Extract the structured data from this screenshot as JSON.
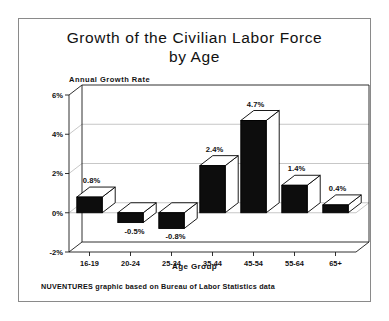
{
  "figure": {
    "title": "Growth of the Civilian Labor Force\nby Age",
    "footer": "NUVENTURES graphic based on Bureau of Labor Statistics data"
  },
  "chart_data": {
    "type": "bar",
    "title": "Growth of the Civilian Labor Force by Age",
    "xlabel": "Age Group",
    "ylabel": "Annual Growth Rate",
    "categories": [
      "16-19",
      "20-24",
      "25-34",
      "35-44",
      "45-54",
      "55-64",
      "65+"
    ],
    "values": [
      0.8,
      -0.5,
      -0.8,
      2.4,
      4.7,
      1.4,
      0.4
    ],
    "value_labels": [
      "0.8%",
      "-0.5%",
      "-0.8%",
      "2.4%",
      "4.7%",
      "1.4%",
      "0.4%"
    ],
    "ylim": [
      -2,
      6
    ],
    "yticks": [
      -2,
      0,
      2,
      4,
      6
    ],
    "ytick_labels": [
      "-2%",
      "0%",
      "2%",
      "4%",
      "6%"
    ],
    "grid": true,
    "legend": false,
    "style": "3d-bars",
    "colors": {
      "bar_front": "#0d0d0d",
      "bar_top": "#ffffff",
      "bar_side": "#ffffff",
      "grid": "#b9b9b9",
      "axis": "#1a1a1a",
      "background": "#ffffff",
      "frame": "#8a8a8a"
    }
  }
}
